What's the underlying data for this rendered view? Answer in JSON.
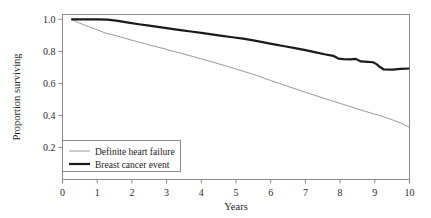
{
  "chart_data": {
    "type": "line",
    "title": "",
    "xlabel": "Years",
    "ylabel": "Proportion surviving",
    "xlim": [
      0,
      10
    ],
    "ylim": [
      0,
      1.03
    ],
    "grid": false,
    "legend_position": "lower-left-inside",
    "xticks": [
      0,
      1,
      2,
      3,
      4,
      5,
      6,
      7,
      8,
      9,
      10
    ],
    "xtick_labels": [
      "0",
      "1",
      "2",
      "3",
      "4",
      "5",
      "6",
      "7",
      "8",
      "9",
      "10"
    ],
    "yticks": [
      0.2,
      0.4,
      0.6,
      0.8,
      1.0
    ],
    "ytick_labels": [
      "0.2",
      "0.4",
      "0.6",
      "0.8",
      "1.0"
    ],
    "series": [
      {
        "name": "Definite heart failure",
        "color": "#9a9a9a",
        "line_width": 1.0,
        "x": [
          0.25,
          0.5,
          0.75,
          1.0,
          1.25,
          1.5,
          1.75,
          2.0,
          2.25,
          2.5,
          2.75,
          3.0,
          3.25,
          3.5,
          3.75,
          4.0,
          4.25,
          4.5,
          4.75,
          5.0,
          5.25,
          5.4,
          5.6,
          5.8,
          6.0,
          6.25,
          6.5,
          6.75,
          7.0,
          7.25,
          7.5,
          7.75,
          8.0,
          8.25,
          8.5,
          8.75,
          9.0,
          9.25,
          9.5,
          9.75,
          10.0
        ],
        "y": [
          1.0,
          0.975,
          0.955,
          0.935,
          0.913,
          0.9,
          0.885,
          0.869,
          0.855,
          0.84,
          0.826,
          0.812,
          0.797,
          0.783,
          0.768,
          0.753,
          0.738,
          0.722,
          0.706,
          0.69,
          0.673,
          0.663,
          0.649,
          0.633,
          0.618,
          0.6,
          0.581,
          0.563,
          0.545,
          0.527,
          0.509,
          0.492,
          0.475,
          0.458,
          0.441,
          0.424,
          0.408,
          0.391,
          0.373,
          0.352,
          0.325
        ]
      },
      {
        "name": "Breast cancer event",
        "color": "#1a1a1a",
        "line_width": 2.2,
        "x": [
          0.25,
          0.6,
          1.0,
          1.3,
          1.6,
          1.9,
          2.2,
          2.5,
          2.8,
          3.1,
          3.4,
          3.7,
          4.0,
          4.3,
          4.6,
          4.9,
          5.2,
          5.5,
          5.8,
          6.1,
          6.4,
          6.7,
          7.0,
          7.3,
          7.55,
          7.8,
          7.95,
          8.1,
          8.3,
          8.45,
          8.6,
          8.8,
          8.95,
          9.05,
          9.15,
          9.25,
          9.5,
          9.75,
          10.0
        ],
        "y": [
          1.0,
          1.0,
          1.0,
          0.998,
          0.99,
          0.979,
          0.969,
          0.96,
          0.951,
          0.942,
          0.933,
          0.924,
          0.915,
          0.906,
          0.897,
          0.888,
          0.879,
          0.868,
          0.856,
          0.844,
          0.832,
          0.82,
          0.808,
          0.794,
          0.782,
          0.772,
          0.755,
          0.752,
          0.75,
          0.753,
          0.737,
          0.734,
          0.732,
          0.72,
          0.702,
          0.688,
          0.686,
          0.69,
          0.693
        ]
      }
    ],
    "annotations": []
  },
  "legend": {
    "entries": [
      {
        "label": "Definite heart failure",
        "swatch": "thin-gray-line"
      },
      {
        "label": "Breast cancer event",
        "swatch": "thick-black-line"
      }
    ]
  },
  "colors": {
    "background": "#ffffff",
    "frame": "#8a8a8a",
    "text": "#1a1a1a",
    "series_gray": "#9a9a9a",
    "series_black": "#1a1a1a"
  }
}
